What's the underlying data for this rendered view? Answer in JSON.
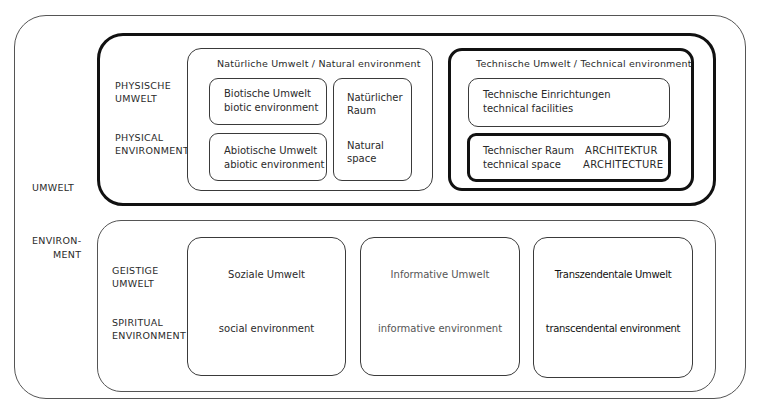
{
  "diagram": {
    "outer": {
      "label_top": "UMWELT",
      "label_bottom": "ENVIRON-\nMENT",
      "label_bottom_line1": "ENVIRON-",
      "label_bottom_line2": "MENT"
    },
    "physical": {
      "label_de_line1": "PHYSISCHE",
      "label_de_line2": "UMWELT",
      "label_en_line1": "PHYSICAL",
      "label_en_line2": "ENVIRONMENT",
      "natural": {
        "title": "Natürliche Umwelt  /  Natural environment",
        "biotic": {
          "de": "Biotische Umwelt",
          "en": "biotic environment"
        },
        "abiotic": {
          "de": "Abiotische Umwelt",
          "en": "abiotic environment"
        },
        "natural_space": {
          "de_line1": "Natürlicher",
          "de_line2": "Raum",
          "en_line1": "Natural",
          "en_line2": "space"
        }
      },
      "technical": {
        "title": "Technische Umwelt  /  Technical environment",
        "facilities": {
          "de": "Technische Einrichtungen",
          "en": "technical facilities"
        },
        "tech_space": {
          "de": "Technischer Raum",
          "en": "technical space",
          "arch_de": "ARCHITEKTUR",
          "arch_en": "ARCHITECTURE"
        }
      }
    },
    "spiritual": {
      "label_de_line1": "GEISTIGE",
      "label_de_line2": "UMWELT",
      "label_en_line1": "SPIRITUAL",
      "label_en_line2": "ENVIRONMENT",
      "social": {
        "de": "Soziale Umwelt",
        "en": "social environment"
      },
      "informative": {
        "de": "Informative Umwelt",
        "en": "informative environment"
      },
      "transcendental": {
        "de": "Transzendentale Umwelt",
        "en": "transcendental environment"
      }
    }
  }
}
